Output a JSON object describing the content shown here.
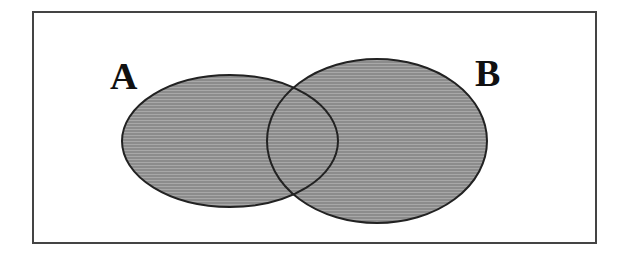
{
  "diagram": {
    "type": "venn",
    "frame": {
      "x": 33,
      "y": 12,
      "width": 563,
      "height": 231,
      "stroke": "#444444",
      "stroke_width": 2,
      "fill": "#ffffff"
    },
    "fill_color": "#8c8c8c",
    "texture_color": "#a8a8a8",
    "outline_color": "#222222",
    "sets": [
      {
        "id": "A",
        "label": "A",
        "label_x": 110,
        "label_y": 89,
        "cx": 230,
        "cy": 141,
        "rx": 108,
        "ry": 66
      },
      {
        "id": "B",
        "label": "B",
        "label_x": 475,
        "label_y": 86,
        "cx": 377,
        "cy": 141,
        "rx": 110,
        "ry": 82
      }
    ]
  }
}
